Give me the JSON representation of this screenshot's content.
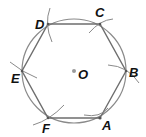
{
  "diagram": {
    "colors": {
      "circle": "#8a8a8a",
      "hexagon": "#6e6e6e",
      "arcs": "#8a8a8a",
      "labels": "#111111",
      "center_dot": "#9a9a9a"
    },
    "center": {
      "label": "O",
      "x": 74,
      "y": 71
    },
    "radius": 52,
    "vertices": [
      {
        "label": "A",
        "x": 100,
        "y": 118,
        "lx": 102,
        "ly": 130
      },
      {
        "label": "B",
        "x": 126,
        "y": 71,
        "lx": 129,
        "ly": 77
      },
      {
        "label": "C",
        "x": 100,
        "y": 24,
        "lx": 95,
        "ly": 17
      },
      {
        "label": "D",
        "x": 48,
        "y": 24,
        "lx": 35,
        "ly": 29
      },
      {
        "label": "E",
        "x": 22,
        "y": 71,
        "lx": 11,
        "ly": 83
      },
      {
        "label": "F",
        "x": 48,
        "y": 118,
        "lx": 42,
        "ly": 133
      }
    ]
  }
}
